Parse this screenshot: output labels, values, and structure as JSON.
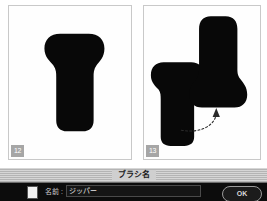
{
  "figures": {
    "panels": [
      {
        "badge": "12",
        "caption_shapes": [
          "zipper-pull-silhouette"
        ]
      },
      {
        "badge": "13",
        "caption_shapes": [
          "zipper-pull-silhouette",
          "zipper-pull-silhouette-large",
          "dotted-curved-arrow"
        ]
      }
    ]
  },
  "dialog": {
    "title": "ブラシ名",
    "name_label": "名前 :",
    "name_value": "ジッパー",
    "name_placeholder": "",
    "ok_label": "OK",
    "colors": {
      "titlebar": "#c6c6c6",
      "body": "#0c0c0c",
      "text": "#cfcfcf",
      "shape_fill": "#000000",
      "panel_border": "#c9c9c9",
      "badge_bg": "#a6a6a6"
    }
  }
}
